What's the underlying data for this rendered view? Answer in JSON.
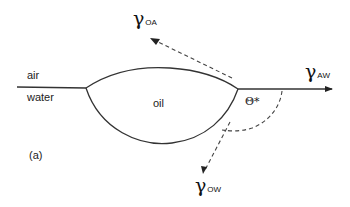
{
  "figure": {
    "panel_label": "(a)",
    "phases": {
      "upper": "air",
      "lower": "water",
      "drop": "oil"
    },
    "tensions": {
      "oil_air": {
        "symbol": "γ",
        "subscript": "OA"
      },
      "air_water": {
        "symbol": "γ",
        "subscript": "AW"
      },
      "oil_water": {
        "symbol": "γ",
        "subscript": "OW"
      }
    },
    "contact_angle": "Θ*",
    "colors": {
      "line": "#333333",
      "text": "#222222",
      "background": "#ffffff"
    }
  }
}
